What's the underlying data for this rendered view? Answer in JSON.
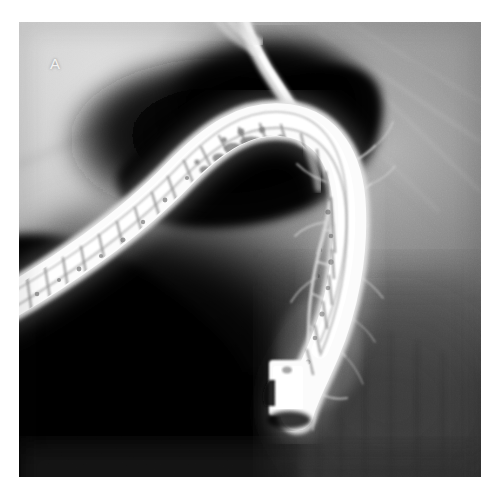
{
  "figure": {
    "panel_label": "A",
    "modality": "radiograph",
    "label_color": "#f2f2f2",
    "plate": {
      "x": 19,
      "y": 22,
      "width": 462,
      "height": 455
    },
    "page": {
      "width": 504,
      "height": 498,
      "background": "#ffffff"
    }
  },
  "palette": {
    "page_background": "#ffffff",
    "plate_black": "#0a0a0a",
    "gas_shadow_black": "#050505",
    "soft_tissue_light_gray": "#c9c9c9",
    "soft_tissue_mid_gray": "#9a9a9a",
    "soft_tissue_dark_gray": "#4e4e4e",
    "spine_gray": "#3a3a3a",
    "contrast_white": "#fafafa",
    "scope_white": "#f4f4f4",
    "scope_marking_dark": "#4a4a4a",
    "duct_white": "#e8e8e8"
  },
  "regions": [
    {
      "name": "upper-left-soft-tissue",
      "description": "light gray mottled soft tissue field, upper left quadrant",
      "tone": "light-gray"
    },
    {
      "name": "gas-shadow-stomach",
      "description": "large black gas-filled stomach and duodenal bulb shadow, upper center-left",
      "tone": "black"
    },
    {
      "name": "right-soft-tissue",
      "description": "mid gray mottled soft tissue with faint diagonal streaks, right side",
      "tone": "mid-gray"
    },
    {
      "name": "vertebral-shadow",
      "description": "darker gray vertically striated spine shadow, lower right",
      "tone": "dark-gray"
    },
    {
      "name": "lower-left-black-field",
      "description": "deep black field below the endoscope, lower left",
      "tone": "black"
    }
  ],
  "anatomy": [
    {
      "name": "duodenoscope-shaft",
      "description": "bright white endoscope entering lower left, arcing over to the right and descending",
      "appearance": "radiopaque white tube with dark banded fiber-bundle markings"
    },
    {
      "name": "duodenoscope-tip",
      "description": "blunt bright distal tip of endoscope at lower center",
      "appearance": "bright rectangular block"
    },
    {
      "name": "contrast-column-bile-duct",
      "description": "bright vertical contrast-filled duct at top center",
      "appearance": "narrow bright white column"
    },
    {
      "name": "pancreatic-duct-branches",
      "description": "fine branching contrast-filled ductal side branches on the right of the scope",
      "appearance": "thin pale arborizing lines"
    }
  ]
}
